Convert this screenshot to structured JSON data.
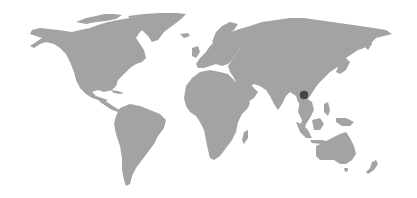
{
  "map": {
    "type": "world-map",
    "land_color": "#a3a3a3",
    "background_color": "#ffffff",
    "marker": {
      "x": 304,
      "y": 95,
      "radius": 4,
      "color": "#454545",
      "region": "Southern China"
    }
  }
}
